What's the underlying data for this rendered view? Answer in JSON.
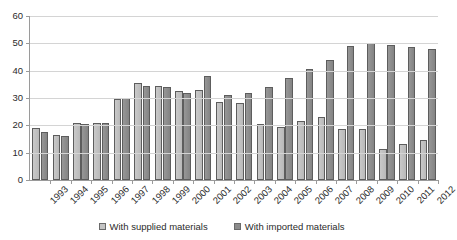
{
  "chart_data": {
    "type": "bar",
    "title": "",
    "subtitle": "",
    "xlabel": "",
    "ylabel": "",
    "ylim": [
      0,
      60
    ],
    "y_ticks": [
      0,
      10,
      20,
      30,
      40,
      50,
      60
    ],
    "grid": true,
    "legend_position": "bottom",
    "categories": [
      "1993",
      "1994",
      "1995",
      "1996",
      "1997",
      "1998",
      "1999",
      "2000",
      "2001",
      "2002",
      "2003",
      "2004",
      "2005",
      "2006",
      "2007",
      "2008",
      "2009",
      "2010",
      "2011",
      "2012"
    ],
    "series": [
      {
        "name": "With supplied materials",
        "color": "#c4c4c4",
        "values": [
          19,
          16.5,
          21,
          21,
          29.5,
          35.5,
          34.5,
          32.5,
          33,
          28.5,
          28,
          20.5,
          19.5,
          21.5,
          23,
          18.5,
          18.5,
          11.5,
          13,
          14.5
        ]
      },
      {
        "name": "With imported materials",
        "color": "#8c8c8c",
        "values": [
          17.5,
          16,
          20.5,
          21,
          30,
          34.5,
          34,
          32,
          38,
          31,
          32,
          34,
          37.5,
          40.5,
          44,
          49,
          50,
          49.5,
          48.5,
          48
        ]
      }
    ]
  },
  "axes": {
    "y_tick_labels": [
      "0",
      "10",
      "20",
      "30",
      "40",
      "50",
      "60"
    ],
    "x_tick_labels": [
      "1993",
      "1994",
      "1995",
      "1996",
      "1997",
      "1998",
      "1999",
      "2000",
      "2001",
      "2002",
      "2003",
      "2004",
      "2005",
      "2006",
      "2007",
      "2008",
      "2009",
      "2010",
      "2011",
      "2012"
    ]
  },
  "legend": {
    "items": [
      {
        "label": "With supplied materials",
        "swatch": "supplied"
      },
      {
        "label": "With imported materials",
        "swatch": "imported"
      }
    ]
  }
}
